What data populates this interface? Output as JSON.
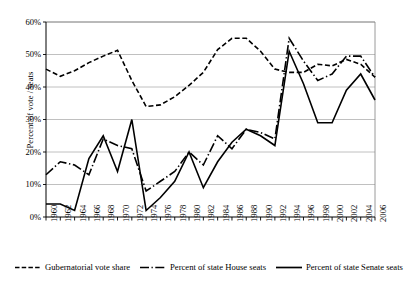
{
  "chart_data": {
    "type": "line",
    "title": "",
    "xlabel": "",
    "ylabel": "Percent of vote / seats",
    "ylim": [
      0,
      60
    ],
    "ytick_labels": [
      "0%",
      "10%",
      "20%",
      "30%",
      "40%",
      "50%",
      "60%"
    ],
    "ytick_values": [
      0,
      10,
      20,
      30,
      40,
      50,
      60
    ],
    "grid": "horizontal",
    "legend_position": "bottom",
    "xlim": [
      1960,
      2006
    ],
    "categories": [
      1960,
      1962,
      1964,
      1966,
      1968,
      1970,
      1972,
      1974,
      1976,
      1978,
      1980,
      1982,
      1984,
      1986,
      1988,
      1990,
      1992,
      1994,
      1996,
      1998,
      2000,
      2002,
      2004,
      2006
    ],
    "xtick_labels": [
      "1960",
      "1962",
      "1964",
      "1966",
      "1968",
      "1970",
      "1972",
      "1974",
      "1976",
      "1978",
      "1980",
      "1982",
      "1984",
      "1986",
      "1988",
      "1990",
      "1992",
      "1994",
      "1996",
      "1998",
      "2000",
      "2002",
      "2004",
      "2006"
    ],
    "series": [
      {
        "name": "Gubernatorial vote share",
        "style": "dashed",
        "color": "#000000",
        "values": [
          45.5,
          43.3,
          45.0,
          47.5,
          49.5,
          51.3,
          42.0,
          34.0,
          34.5,
          37.0,
          40.5,
          44.5,
          51.5,
          55.0,
          55.0,
          51.0,
          45.5,
          44.5,
          44.5,
          47.0,
          46.5,
          48.5,
          47.0,
          43.0
        ]
      },
      {
        "name": "Percent of state House seats",
        "style": "dash-dot",
        "color": "#000000",
        "values": [
          13.0,
          17.0,
          16.0,
          13.0,
          24.0,
          22.0,
          21.0,
          8.0,
          11.0,
          14.0,
          20.0,
          16.0,
          25.0,
          21.0,
          27.0,
          26.0,
          24.0,
          55.0,
          48.0,
          42.0,
          44.0,
          49.5,
          49.5,
          43.0
        ]
      },
      {
        "name": "Percent of state Senate seats",
        "style": "solid",
        "color": "#000000",
        "values": [
          4.0,
          4.0,
          2.0,
          18.0,
          25.0,
          14.0,
          30.0,
          2.0,
          6.0,
          11.0,
          20.0,
          9.0,
          17.0,
          23.0,
          27.0,
          25.0,
          22.0,
          51.0,
          41.0,
          29.0,
          29.0,
          39.0,
          44.0,
          36.0
        ]
      }
    ]
  },
  "legend": {
    "entries": [
      {
        "label": "Gubernatorial vote share",
        "swatch": "dashed-line-swatch"
      },
      {
        "label": "Percent of state House seats",
        "swatch": "dash-dot-line-swatch"
      },
      {
        "label": "Percent of state Senate seats",
        "swatch": "solid-line-swatch"
      }
    ]
  }
}
